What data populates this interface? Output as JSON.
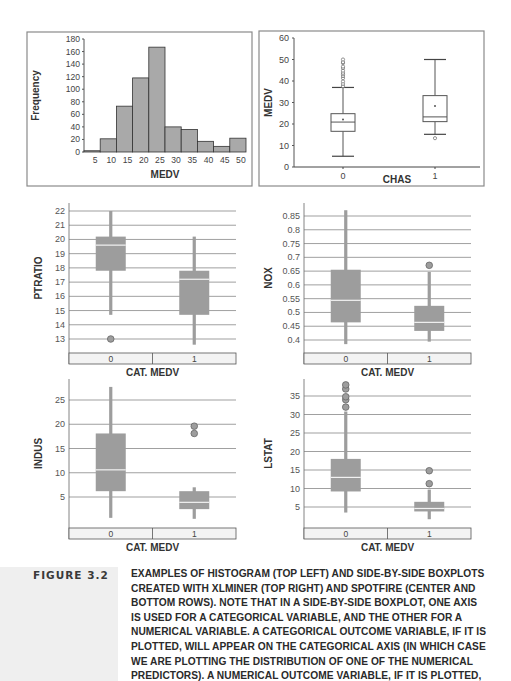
{
  "figure": {
    "label": "FIGURE 3.2",
    "caption_lines": [
      "EXAMPLES OF HISTOGRAM (TOP LEFT) AND SIDE-BY-SIDE BOXPLOTS",
      "CREATED WITH XLMINER (TOP RIGHT) AND SPOTFIRE (CENTER AND",
      "BOTTOM ROWS). NOTE THAT IN A SIDE-BY-SIDE BOXPLOT, ONE AXIS",
      "IS USED FOR A CATEGORICAL VARIABLE, AND THE OTHER FOR A",
      "NUMERICAL VARIABLE. A CATEGORICAL OUTCOME VARIABLE, IF IT IS",
      "PLOTTED, WILL APPEAR ON THE CATEGORICAL AXIS (IN WHICH CASE",
      "WE ARE PLOTTING THE DISTRIBUTION OF ONE OF THE NUMERICAL",
      "PREDICTORS). A NUMERICAL OUTCOME VARIABLE, IF IT IS PLOTTED,"
    ]
  },
  "colors": {
    "bar_fill": "#a9a9a9",
    "spotfire_box": "#9d9d9d",
    "median_line": "#f2f2f2",
    "grid": "#777777",
    "frame": "#8a8a8a",
    "cat_bar_fill": "#f3f3f3"
  },
  "chart_data": [
    {
      "id": "histogram",
      "type": "bar",
      "title": "",
      "xlabel": "MEDV",
      "ylabel": "Frequency",
      "categories": [
        "5",
        "10",
        "15",
        "20",
        "25",
        "30",
        "35",
        "40",
        "45",
        "50"
      ],
      "values": [
        2,
        21,
        73,
        118,
        167,
        40,
        36,
        17,
        9,
        22
      ],
      "ylim": [
        0,
        180
      ],
      "yticks": [
        0,
        20,
        40,
        60,
        80,
        100,
        120,
        140,
        160,
        180
      ],
      "grid": false,
      "position": "top-left"
    },
    {
      "id": "medv_by_chas",
      "type": "boxplot",
      "style": "xlminer",
      "title": "",
      "xlabel": "CHAS",
      "ylabel": "MEDV",
      "categories": [
        "0",
        "1"
      ],
      "ylim": [
        0,
        60
      ],
      "yticks": [
        0,
        10,
        20,
        30,
        40,
        50,
        60
      ],
      "grid": false,
      "series": [
        {
          "category": "0",
          "whisker_low": 5,
          "q1": 16.6,
          "median": 20.9,
          "q3": 24.8,
          "whisker_high": 37,
          "mean": 22.1,
          "outliers": [
            37.6,
            38.7,
            39.8,
            41.3,
            42.3,
            43.1,
            43.8,
            44.8,
            46,
            46.7,
            48.3,
            48.8,
            50
          ]
        },
        {
          "category": "1",
          "whisker_low": 15.2,
          "q1": 21.1,
          "median": 23.3,
          "q3": 33.2,
          "whisker_high": 50,
          "mean": 28.4,
          "outliers": [
            13.4
          ]
        }
      ],
      "position": "top-right"
    },
    {
      "id": "ptratio_by_catmedv",
      "type": "boxplot",
      "style": "spotfire",
      "title": "",
      "xlabel": "CAT. MEDV",
      "ylabel": "PTRATIO",
      "categories": [
        "0",
        "1"
      ],
      "ylim": [
        12,
        22.3
      ],
      "yticks": [
        13,
        14,
        15,
        16,
        17,
        18,
        19,
        20,
        21,
        22
      ],
      "grid": true,
      "series": [
        {
          "category": "0",
          "whisker_low": 14.7,
          "q1": 17.8,
          "median": 19.6,
          "q3": 20.2,
          "whisker_high": 22,
          "outliers": [
            13
          ]
        },
        {
          "category": "1",
          "whisker_low": 12.6,
          "q1": 14.7,
          "median": 17.2,
          "q3": 17.8,
          "whisker_high": 20.2,
          "outliers": []
        }
      ],
      "position": "center-left"
    },
    {
      "id": "nox_by_catmedv",
      "type": "boxplot",
      "style": "spotfire",
      "title": "",
      "xlabel": "CAT. MEDV",
      "ylabel": "NOX",
      "categories": [
        "0",
        "1"
      ],
      "ylim": [
        0.36,
        0.87
      ],
      "yticks": [
        0.4,
        0.45,
        0.5,
        0.55,
        0.6,
        0.65,
        0.7,
        0.75,
        0.8,
        0.85
      ],
      "grid": true,
      "series": [
        {
          "category": "0",
          "whisker_low": 0.385,
          "q1": 0.464,
          "median": 0.544,
          "q3": 0.655,
          "whisker_high": 0.871,
          "outliers": []
        },
        {
          "category": "1",
          "whisker_low": 0.394,
          "q1": 0.433,
          "median": 0.464,
          "q3": 0.524,
          "whisker_high": 0.647,
          "outliers": [
            0.671
          ]
        }
      ],
      "position": "center-right"
    },
    {
      "id": "indus_by_catmedv",
      "type": "boxplot",
      "style": "spotfire",
      "title": "",
      "xlabel": "CAT. MEDV",
      "ylabel": "INDUS",
      "categories": [
        "0",
        "1"
      ],
      "ylim": [
        0,
        28
      ],
      "yticks": [
        5,
        10,
        15,
        20,
        25
      ],
      "grid": true,
      "series": [
        {
          "category": "0",
          "whisker_low": 0.7,
          "q1": 6.2,
          "median": 10.6,
          "q3": 18.1,
          "whisker_high": 27.7,
          "outliers": []
        },
        {
          "category": "1",
          "whisker_low": 0.5,
          "q1": 2.5,
          "median": 3.9,
          "q3": 6.2,
          "whisker_high": 7,
          "outliers": [
            18.1,
            19.6
          ]
        }
      ],
      "position": "bottom-left"
    },
    {
      "id": "lstat_by_catmedv",
      "type": "boxplot",
      "style": "spotfire",
      "title": "",
      "xlabel": "CAT. MEDV",
      "ylabel": "LSTAT",
      "categories": [
        "0",
        "1"
      ],
      "ylim": [
        0,
        38
      ],
      "yticks": [
        5,
        10,
        15,
        20,
        25,
        30,
        35
      ],
      "grid": true,
      "series": [
        {
          "category": "0",
          "whisker_low": 3.5,
          "q1": 9.2,
          "median": 13,
          "q3": 18,
          "whisker_high": 30.8,
          "outliers": [
            32,
            34,
            34.8,
            36.9,
            38
          ]
        },
        {
          "category": "1",
          "whisker_low": 1.7,
          "q1": 3.8,
          "median": 4.6,
          "q3": 6.4,
          "whisker_high": 9.7,
          "outliers": [
            11.3,
            14.8
          ]
        }
      ],
      "position": "bottom-right"
    }
  ]
}
